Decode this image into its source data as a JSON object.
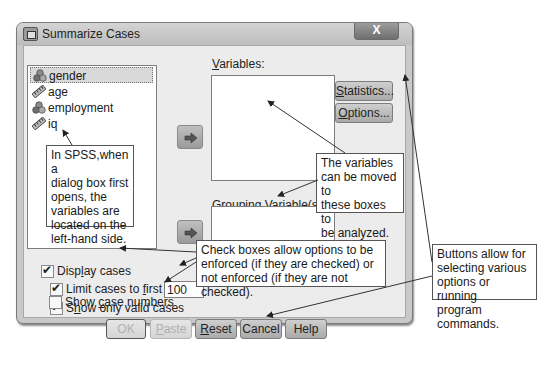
{
  "window": {
    "title": "Summarize Cases",
    "close_label": "X"
  },
  "source_list": {
    "items": [
      {
        "name": "gender",
        "type": "nominal",
        "icon": "nominal-variable-icon",
        "selected": true
      },
      {
        "name": "age",
        "type": "scale",
        "icon": "scale-variable-icon",
        "selected": false
      },
      {
        "name": "employment",
        "type": "nominal",
        "icon": "nominal-variable-icon",
        "selected": false
      },
      {
        "name": "iq",
        "type": "scale",
        "icon": "scale-variable-icon",
        "selected": false
      }
    ]
  },
  "variables": {
    "label_underlined": "V",
    "label_rest": "ariables:",
    "items": []
  },
  "grouping": {
    "label_underlined": "G",
    "label_rest": "rouping Variable(s):",
    "items": []
  },
  "move_buttons": {
    "icon": "arrow-right-icon"
  },
  "side_buttons": {
    "statistics": {
      "u": "S",
      "rest": "tatistics..."
    },
    "options": {
      "u": "O",
      "rest": "ptions..."
    }
  },
  "checkboxes": {
    "display_cases": {
      "pre": "Disp",
      "u": "l",
      "post": "ay cases",
      "checked": true
    },
    "limit_cases": {
      "pre": "Limit cases to ",
      "u": "f",
      "post": "irst",
      "checked": true,
      "value": "100"
    },
    "show_valid": {
      "pre": "S",
      "u": "h",
      "post": "ow only valid cases",
      "checked": true
    },
    "show_case_numbers": {
      "pre": "Show ",
      "u": "c",
      "post": "ase numbers",
      "checked": false
    }
  },
  "bottom_buttons": {
    "ok": {
      "label": "OK",
      "enabled": false
    },
    "paste": {
      "u": "P",
      "rest": "aste",
      "enabled": false
    },
    "reset": {
      "u": "R",
      "rest": "eset",
      "enabled": true
    },
    "cancel": {
      "label": "Cancel",
      "enabled": true
    },
    "help": {
      "label": "Help",
      "enabled": true
    }
  },
  "annotations": {
    "left_panel": [
      "In SPSS,when a",
      "dialog box first",
      "opens, the",
      "variables are",
      "located on the",
      "left-hand side."
    ],
    "target_boxes": [
      "The variables",
      "can be moved to",
      "these boxes to",
      "be analyzed."
    ],
    "checkboxes": [
      "Check boxes allow options to be",
      "enforced (if they are checked) or",
      "not enforced (if they are not checked)."
    ],
    "buttons": [
      "Buttons allow for",
      "selecting various",
      "options or running",
      "program commands."
    ]
  }
}
